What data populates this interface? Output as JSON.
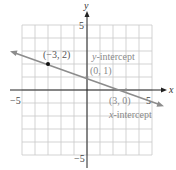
{
  "chart_data": {
    "type": "line",
    "title": "",
    "xlabel": "x",
    "ylabel": "y",
    "xlim": [
      -5,
      5
    ],
    "ylim": [
      -5,
      5
    ],
    "grid": true,
    "x_tick_labels": [
      "-5",
      "5"
    ],
    "y_tick_labels": [
      "5",
      "-5"
    ],
    "series": [
      {
        "name": "line",
        "equation": "y = -x/3 + 1",
        "points": [
          {
            "x": -3,
            "y": 2,
            "label": "(−3, 2)"
          },
          {
            "x": 0,
            "y": 1,
            "label": "(0, 1)"
          },
          {
            "x": 3,
            "y": 0,
            "label": "(3, 0)"
          }
        ],
        "color": "#8c8c8c"
      }
    ],
    "annotations": [
      {
        "text": "y-intercept",
        "point": "(0, 1)"
      },
      {
        "text": "x-intercept",
        "point": "(3, 0)"
      }
    ]
  },
  "labels": {
    "x_axis": "x",
    "y_axis": "y",
    "x_min": "−5",
    "x_max": "5",
    "y_max": "5",
    "y_min": "−5",
    "point_a": "(−3, 2)",
    "point_b": "(0, 1)",
    "point_c": "(3, 0)",
    "y_intercept_prefix": "y",
    "y_intercept_suffix": "-intercept",
    "x_intercept_prefix": "x",
    "x_intercept_suffix": "-intercept"
  },
  "colors": {
    "grid": "#c8c8c8",
    "axis": "#222222",
    "line": "#8c8c8c",
    "point": "#111111",
    "label": "#8a8a8a"
  }
}
